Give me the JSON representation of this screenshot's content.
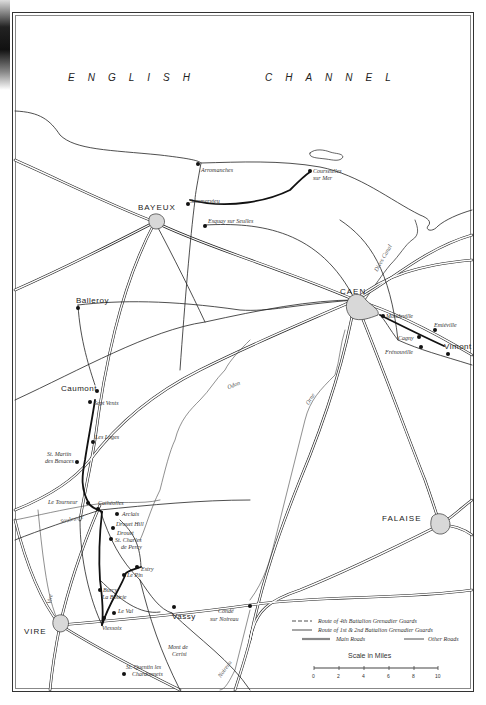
{
  "map": {
    "sea_label": {
      "left": "ENGLISH",
      "right": "CHANNEL"
    },
    "towns_major": [
      {
        "name": "BAYEUX",
        "x": 138,
        "y": 204
      },
      {
        "name": "CAEN",
        "x": 340,
        "y": 288
      },
      {
        "name": "FALAISE",
        "x": 382,
        "y": 515
      },
      {
        "name": "VIRE",
        "x": 24,
        "y": 628
      }
    ],
    "places": [
      {
        "name": "Arromanches",
        "x": 201,
        "y": 170
      },
      {
        "name": "Courseulles",
        "x": 304,
        "y": 171
      },
      {
        "name": "sur Mer",
        "x": 304,
        "y": 178
      },
      {
        "name": "Sommervieu",
        "x": 190,
        "y": 200
      },
      {
        "name": "Esquay sur Seulles",
        "x": 208,
        "y": 219
      },
      {
        "name": "Balleroy",
        "x": 76,
        "y": 297
      },
      {
        "name": "Caumont",
        "x": 61,
        "y": 385
      },
      {
        "name": "Sept Vents",
        "x": 96,
        "y": 400
      },
      {
        "name": "Les Loges",
        "x": 95,
        "y": 434
      },
      {
        "name": "St. Martin",
        "x": 47,
        "y": 452
      },
      {
        "name": "des Besaces",
        "x": 45,
        "y": 459
      },
      {
        "name": "Le Tourneur",
        "x": 48,
        "y": 500
      },
      {
        "name": "Cathéolles",
        "x": 98,
        "y": 502
      },
      {
        "name": "Arclais",
        "x": 118,
        "y": 512
      },
      {
        "name": "Drouet Hill",
        "x": 116,
        "y": 522
      },
      {
        "name": "Drouet",
        "x": 116,
        "y": 531
      },
      {
        "name": "St. Charles",
        "x": 115,
        "y": 538
      },
      {
        "name": "de Percy",
        "x": 121,
        "y": 544
      },
      {
        "name": "Estry",
        "x": 141,
        "y": 567
      },
      {
        "name": "Le Pin",
        "x": 126,
        "y": 573
      },
      {
        "name": "Burcy",
        "x": 103,
        "y": 587
      },
      {
        "name": "La Bottrie",
        "x": 102,
        "y": 595
      },
      {
        "name": "Le Val",
        "x": 118,
        "y": 610
      },
      {
        "name": "Vassy",
        "x": 172,
        "y": 613
      },
      {
        "name": "Viessoix",
        "x": 102,
        "y": 625
      },
      {
        "name": "Condé",
        "x": 218,
        "y": 610
      },
      {
        "name": "sur Noireau",
        "x": 210,
        "y": 618
      },
      {
        "name": "Mont de",
        "x": 168,
        "y": 645
      },
      {
        "name": "Cerisi",
        "x": 172,
        "y": 652
      },
      {
        "name": "St. Quentin les",
        "x": 126,
        "y": 665
      },
      {
        "name": "Chardonnets",
        "x": 132,
        "y": 672
      },
      {
        "name": "Mondeville",
        "x": 383,
        "y": 315
      },
      {
        "name": "Emiéville",
        "x": 434,
        "y": 322
      },
      {
        "name": "Cagny",
        "x": 398,
        "y": 335
      },
      {
        "name": "Vimont",
        "x": 444,
        "y": 346
      },
      {
        "name": "Frénouville",
        "x": 385,
        "y": 349
      }
    ],
    "rivers": [
      {
        "name": "Odon",
        "x": 227,
        "y": 382,
        "rotate": -22
      },
      {
        "name": "Orne",
        "x": 304,
        "y": 396,
        "rotate": -60
      },
      {
        "name": "Souleuvre",
        "x": 60,
        "y": 516,
        "rotate": -12
      },
      {
        "name": "Noireau",
        "x": 215,
        "y": 666,
        "rotate": -55
      },
      {
        "name": "Vire",
        "x": 45,
        "y": 596,
        "rotate": -80
      },
      {
        "name": "Dives Canal",
        "x": 375,
        "y": 255,
        "rotate": -60
      }
    ]
  },
  "legend": {
    "items": [
      {
        "label": "Route of 4th Battalion Grenadier Guards",
        "style": "route4"
      },
      {
        "label": "Route of 1st & 2nd Battalion Grenadier Guards",
        "style": "route12"
      },
      {
        "label": "Main Roads",
        "style": "main"
      },
      {
        "label": "Other Roads",
        "style": "other"
      }
    ],
    "scale_title": "Scale in Miles",
    "scale_ticks": [
      "0",
      "2",
      "4",
      "6",
      "8",
      "10"
    ]
  },
  "colors": {
    "ink": "#222222",
    "paper": "#ffffff",
    "town_fill": "#d8d8d8"
  }
}
